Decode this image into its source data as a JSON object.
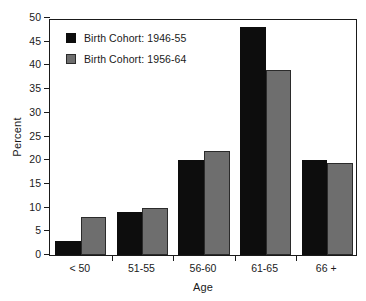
{
  "chart_data": {
    "type": "bar",
    "title": "",
    "subtitle": "",
    "xlabel": "Age",
    "ylabel": "Percent",
    "categories": [
      "< 50",
      "51-55",
      "56-60",
      "61-65",
      "66 +"
    ],
    "series": [
      {
        "name": "Birth Cohort: 1946-55",
        "color": "#0d0d0d",
        "values": [
          3,
          9,
          20,
          48,
          20
        ]
      },
      {
        "name": "Birth Cohort: 1956-64",
        "color": "#6e6e6e",
        "values": [
          8,
          10,
          22,
          39,
          19.5
        ]
      }
    ],
    "ylim": [
      0,
      50
    ],
    "ytick_step": 5,
    "yticks": [
      0,
      5,
      10,
      15,
      20,
      25,
      30,
      35,
      40,
      45,
      50
    ],
    "ytick_labels": [
      "0",
      "5",
      "10",
      "15",
      "20",
      "25",
      "30",
      "35",
      "40",
      "45",
      "50"
    ],
    "grid": false,
    "legend_position": "upper-left",
    "frame": true
  }
}
